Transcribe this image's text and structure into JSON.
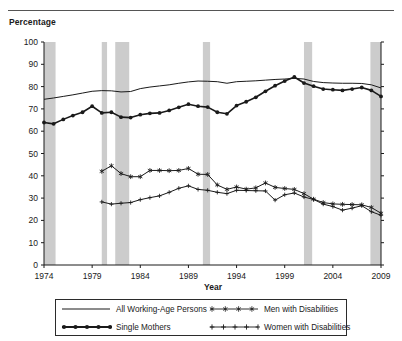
{
  "header": {
    "y_axis_caption": "Percentage"
  },
  "chart_data": {
    "type": "line",
    "title": "",
    "xlabel": "Year",
    "ylabel": "Percentage",
    "xlim": [
      1974,
      2009
    ],
    "ylim": [
      0,
      100
    ],
    "ytick_values": [
      0,
      10,
      20,
      30,
      40,
      50,
      60,
      70,
      80,
      90,
      100
    ],
    "ytick_labels": [
      "0",
      "10",
      "20",
      "30",
      "40",
      "50",
      "60",
      "70",
      "80",
      "90",
      "100"
    ],
    "xtick_values": [
      1974,
      1979,
      1984,
      1989,
      1994,
      1999,
      2004,
      2009
    ],
    "xtick_labels": [
      "1974",
      "1979",
      "1984",
      "1989",
      "1994",
      "1999",
      "2004",
      "2009"
    ],
    "grid": false,
    "legend_position": "bottom",
    "shaded_bands_label": "recession-bands",
    "shaded_band_color": "#cccccc",
    "shaded_bands": [
      {
        "start": 1974.0,
        "end": 1975.2
      },
      {
        "start": 1980.0,
        "end": 1980.55
      },
      {
        "start": 1981.4,
        "end": 1982.85
      },
      {
        "start": 1990.5,
        "end": 1991.25
      },
      {
        "start": 2001.0,
        "end": 2001.85
      },
      {
        "start": 2007.9,
        "end": 2009.0
      }
    ],
    "series": [
      {
        "name": "All Working-Age Persons",
        "marker": "none",
        "color": "#1a1a1a",
        "x": [
          1974,
          1975,
          1976,
          1977,
          1978,
          1979,
          1980,
          1981,
          1982,
          1983,
          1984,
          1985,
          1986,
          1987,
          1988,
          1989,
          1990,
          1991,
          1992,
          1993,
          1994,
          1995,
          1996,
          1997,
          1998,
          1999,
          2000,
          2001,
          2002,
          2003,
          2004,
          2005,
          2006,
          2007,
          2008,
          2009
        ],
        "values": [
          74.3,
          74.9,
          75.6,
          76.3,
          77.1,
          77.9,
          78.2,
          78.1,
          77.6,
          77.8,
          79.1,
          79.8,
          80.3,
          80.8,
          81.5,
          82.1,
          82.5,
          82.4,
          82.2,
          81.5,
          82.2,
          82.4,
          82.6,
          82.9,
          83.2,
          83.4,
          83.7,
          83.4,
          82.3,
          81.8,
          81.6,
          81.5,
          81.5,
          81.4,
          80.8,
          79.4
        ]
      },
      {
        "name": "Single Mothers",
        "marker": "filled-circle",
        "color": "#1a1a1a",
        "x": [
          1974,
          1975,
          1976,
          1977,
          1978,
          1979,
          1980,
          1981,
          1982,
          1983,
          1984,
          1985,
          1986,
          1987,
          1988,
          1989,
          1990,
          1991,
          1992,
          1993,
          1994,
          1995,
          1996,
          1997,
          1998,
          1999,
          2000,
          2001,
          2002,
          2003,
          2004,
          2005,
          2006,
          2007,
          2008,
          2009
        ],
        "values": [
          63.9,
          63.3,
          65.3,
          67.0,
          68.5,
          71.2,
          68.2,
          68.5,
          66.3,
          66.1,
          67.4,
          68.0,
          68.2,
          69.3,
          70.7,
          72.1,
          71.2,
          70.8,
          68.5,
          67.8,
          71.5,
          73.2,
          75.2,
          77.9,
          80.4,
          82.5,
          84.3,
          81.6,
          80.2,
          78.9,
          78.6,
          78.3,
          78.9,
          79.6,
          78.3,
          75.6
        ]
      },
      {
        "name": "Men with Disabilities",
        "marker": "star",
        "color": "#1a1a1a",
        "x": [
          1980,
          1981,
          1982,
          1983,
          1984,
          1985,
          1986,
          1987,
          1988,
          1989,
          1990,
          1991,
          1992,
          1993,
          1994,
          1995,
          1996,
          1997,
          1998,
          1999,
          2000,
          2001,
          2002,
          2003,
          2004,
          2005,
          2006,
          2007,
          2008,
          2009
        ],
        "values": [
          42.0,
          44.5,
          41.0,
          39.6,
          39.6,
          42.4,
          42.4,
          42.3,
          42.4,
          43.3,
          40.7,
          40.6,
          35.9,
          33.9,
          35.0,
          34.0,
          34.6,
          36.8,
          34.8,
          34.3,
          33.9,
          32.0,
          29.5,
          28.0,
          27.4,
          27.2,
          27.1,
          27.0,
          25.8,
          23.2
        ]
      },
      {
        "name": "Women with Disabilities",
        "marker": "plus",
        "color": "#1a1a1a",
        "x": [
          1980,
          1981,
          1982,
          1983,
          1984,
          1985,
          1986,
          1987,
          1988,
          1989,
          1990,
          1991,
          1992,
          1993,
          1994,
          1995,
          1996,
          1997,
          1998,
          1999,
          2000,
          2001,
          2002,
          2003,
          2004,
          2005,
          2006,
          2007,
          2008,
          2009
        ],
        "values": [
          28.3,
          27.3,
          27.7,
          28.0,
          29.3,
          30.2,
          31.0,
          32.6,
          34.4,
          35.5,
          33.9,
          33.5,
          32.6,
          32.0,
          33.5,
          33.4,
          33.3,
          33.2,
          29.1,
          31.5,
          32.3,
          30.5,
          29.4,
          27.3,
          26.2,
          24.6,
          25.5,
          26.6,
          23.9,
          22.3
        ]
      }
    ]
  },
  "legend": {
    "entries": [
      {
        "label": "All Working-Age Persons",
        "marker": "none"
      },
      {
        "label": "Men with Disabilities",
        "marker": "star"
      },
      {
        "label": "Single Mothers",
        "marker": "filled-circle"
      },
      {
        "label": "Women with Disabilities",
        "marker": "plus"
      }
    ]
  }
}
